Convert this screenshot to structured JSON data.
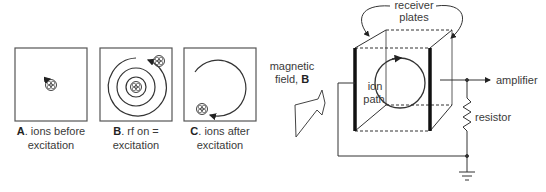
{
  "panels": [
    {
      "letter": "A",
      "caption_line1": ". ions before",
      "caption_line2": "excitation"
    },
    {
      "letter": "B",
      "caption_line1": ". rf on =",
      "caption_line2": "excitation"
    },
    {
      "letter": "C",
      "caption_line1": ". ions after",
      "caption_line2": "excitation"
    }
  ],
  "cell": {
    "receiver_plates_line1": "receiver",
    "receiver_plates_line2": "plates",
    "magnetic_field_line1": "magnetic",
    "magnetic_field_line2": "field, ",
    "magnetic_field_symbol": "B",
    "ion_path_line1": "ion",
    "ion_path_line2": "path",
    "amplifier": "amplifier",
    "resistor": "resistor"
  },
  "colors": {
    "stroke": "#333333",
    "text": "#3a3a3a"
  }
}
